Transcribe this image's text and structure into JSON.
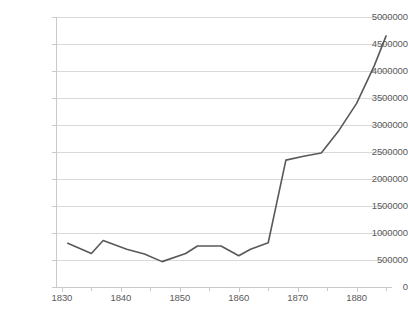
{
  "chart_data": {
    "type": "line",
    "title": "",
    "xlabel": "",
    "ylabel": "",
    "xlim": [
      1829,
      1886
    ],
    "ylim": [
      0,
      5000000
    ],
    "grid": true,
    "legend": "none",
    "line_color": "#595959",
    "gridline_color": "#D9D9D9",
    "axis_color": "#C9C9C9",
    "label_color": "#5A5A5A",
    "x_ticks": [
      1830,
      1840,
      1850,
      1860,
      1870,
      1880
    ],
    "x_tick_labels": [
      "1830",
      "1840",
      "1850",
      "1860",
      "1870",
      "1880"
    ],
    "x_minor_ticks": [
      1835,
      1845,
      1855,
      1865,
      1875,
      1885
    ],
    "y_ticks": [
      0,
      500000,
      1000000,
      1500000,
      2000000,
      2500000,
      3000000,
      3500000,
      4000000,
      4500000,
      5000000
    ],
    "y_tick_labels": [
      "0",
      "500000",
      "1000000",
      "1500000",
      "2000000",
      "2500000",
      "3000000",
      "3500000",
      "4000000",
      "4500000",
      "5000000"
    ],
    "series": [
      {
        "name": "series-1",
        "x": [
          1831,
          1835,
          1837,
          1841,
          1844,
          1847,
          1851,
          1853,
          1857,
          1860,
          1862,
          1865,
          1868,
          1871,
          1874,
          1877,
          1880,
          1883,
          1885
        ],
        "values": [
          810000,
          620000,
          860000,
          700000,
          610000,
          470000,
          620000,
          760000,
          760000,
          580000,
          700000,
          820000,
          2350000,
          2420000,
          2480000,
          2900000,
          3400000,
          4100000,
          4650000
        ]
      }
    ]
  }
}
